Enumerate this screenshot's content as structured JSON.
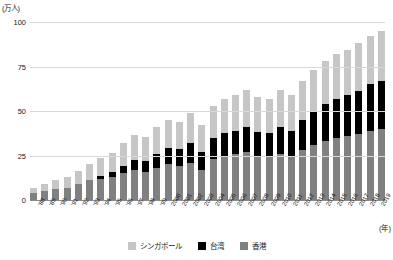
{
  "chart_data": {
    "type": "bar",
    "stacked": true,
    "title": "",
    "subtitle": "",
    "xlabel": "(年)",
    "ylabel": "(万人)",
    "ylim": [
      0,
      100
    ],
    "yticks": [
      0,
      25,
      50,
      75,
      100
    ],
    "grid": true,
    "legend_position": "bottom",
    "categories": [
      "'88",
      "'89",
      "'90",
      "'91",
      "'92",
      "'93",
      "'94",
      "'95",
      "'96",
      "'97",
      "'98",
      "'99",
      "2000",
      "2001",
      "2002",
      "2003",
      "2004",
      "2005",
      "2006",
      "2007",
      "2008",
      "2009",
      "2010",
      "2011",
      "2012",
      "2013",
      "2014",
      "2015",
      "2016",
      "2017",
      "2018",
      "2019"
    ],
    "series": [
      {
        "name": "香港",
        "color": "#808080",
        "values": [
          4.0,
          5.0,
          6.0,
          7.0,
          9.0,
          11.0,
          12.0,
          13.0,
          15.0,
          17.0,
          16.0,
          18.0,
          20.0,
          19.0,
          21.0,
          17.0,
          23.0,
          25.0,
          26.0,
          27.0,
          25.0,
          24.0,
          26.0,
          24.0,
          28.0,
          31.0,
          33.0,
          35.0,
          36.0,
          37.0,
          39.0,
          40.0
        ]
      },
      {
        "name": "台湾",
        "color": "#000000",
        "values": [
          0.0,
          0.0,
          0.0,
          0.0,
          0.0,
          0.0,
          1.5,
          2.5,
          4.0,
          5.5,
          6.0,
          8.0,
          9.0,
          9.5,
          11.0,
          10.0,
          12.0,
          12.5,
          13.0,
          14.0,
          13.0,
          13.5,
          15.0,
          14.5,
          17.0,
          19.0,
          21.0,
          22.0,
          23.0,
          24.5,
          26.0,
          27.0
        ]
      },
      {
        "name": "シンガポール",
        "color": "#c6c6c6",
        "values": [
          3.0,
          4.0,
          5.0,
          6.0,
          7.5,
          9.0,
          10.0,
          11.0,
          13.0,
          14.0,
          13.5,
          15.0,
          16.0,
          15.5,
          17.0,
          15.0,
          18.0,
          19.0,
          20.0,
          21.0,
          20.0,
          19.5,
          21.0,
          20.5,
          22.0,
          23.0,
          24.0,
          25.0,
          25.5,
          26.5,
          27.0,
          28.0
        ]
      }
    ],
    "totals": [
      7.0,
      9.0,
      11.0,
      13.0,
      16.5,
      20.0,
      23.5,
      26.5,
      32.0,
      36.5,
      35.5,
      41.0,
      45.0,
      44.0,
      49.0,
      42.0,
      53.0,
      56.5,
      59.0,
      62.0,
      58.0,
      57.0,
      62.0,
      59.0,
      67.0,
      73.0,
      78.0,
      82.0,
      84.5,
      88.0,
      92.0,
      95.0
    ]
  },
  "legend": {
    "items": [
      {
        "label": "シンガポール",
        "color": "#c6c6c6"
      },
      {
        "label": "台湾",
        "color": "#000000"
      },
      {
        "label": "香港",
        "color": "#808080"
      }
    ]
  },
  "axes": {
    "y_unit": "(万人)",
    "x_unit": "(年)"
  }
}
